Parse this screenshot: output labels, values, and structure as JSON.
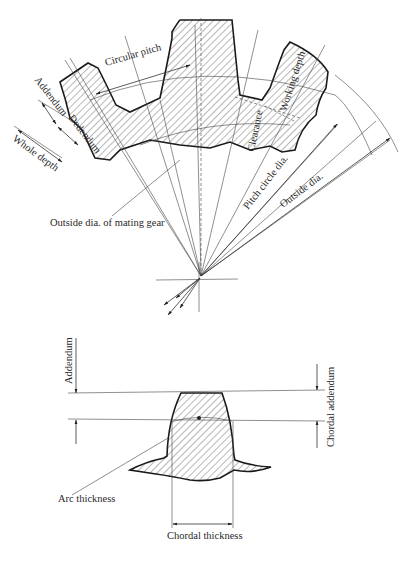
{
  "figure": {
    "top_diagram": {
      "name": "Gear tooth nomenclature",
      "labels": {
        "circular_pitch": "Circular pitch",
        "addendum": "Addendum",
        "dedendum": "Dedendum",
        "whole_depth": "Whole depth",
        "working_depth": "Working depth",
        "clearance": "Clearance",
        "pitch_circle_dia": "Pitch circle dia.",
        "outside_dia": "Outside dia.",
        "outside_dia_mating": "Outside dia. of mating gear"
      }
    },
    "bottom_diagram": {
      "name": "Chordal tooth measurement",
      "labels": {
        "addendum": "Addendum",
        "chordal_addendum": "Chordal addendum",
        "arc_thickness": "Arc thickness",
        "chordal_thickness": "Chordal thickness"
      }
    },
    "colors": {
      "ink": "#1a1a1a",
      "background": "#ffffff"
    }
  }
}
